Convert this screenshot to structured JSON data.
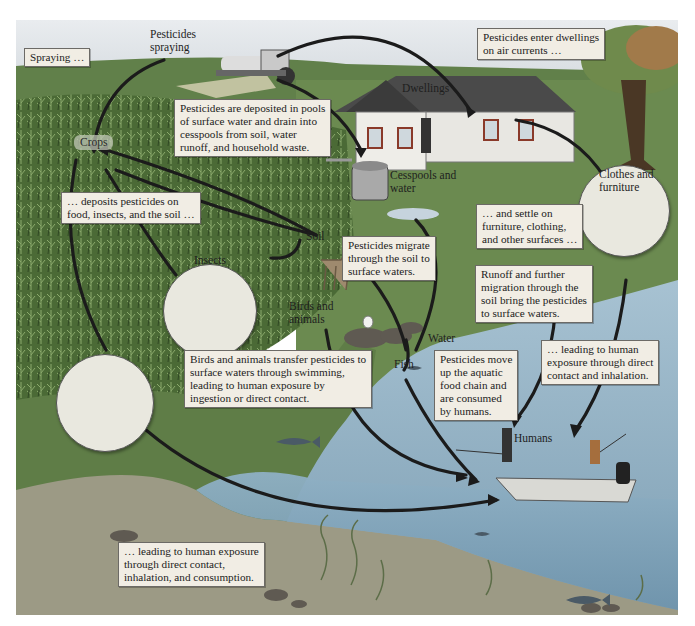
{
  "figure": {
    "colors": {
      "sky": "#dfe3e8",
      "field_green": "#5d7a45",
      "crop_dark": "#3f5a2e",
      "grass": "#6e8a52",
      "water": "#8fb0c4",
      "water_deep": "#7a9fb6",
      "shore": "#9a9a83",
      "callout_bg": "#f1ede4",
      "arrow": "#1c1c1c"
    }
  },
  "labels": {
    "pesticides_spraying": "Pesticides\nspraying",
    "dwellings": "Dwellings",
    "crops": "Crops",
    "cesspools": "Cesspools and\nwater",
    "soil": "Soil",
    "insects": "Insects",
    "birds_animals": "Birds and\nanimals",
    "water": "Water",
    "fish": "Fish",
    "clothes_furniture": "Clothes and\nfurniture",
    "humans": "Humans"
  },
  "callouts": {
    "spraying": "Spraying …",
    "enter_dwellings": "Pesticides enter dwellings\non air currents …",
    "deposited_pools": "Pesticides are deposited in pools\nof surface water and drain into\ncesspools from soil, water\nrunoff, and household waste.",
    "deposits_food": "… deposits pesticides on\nfood, insects, and the soil …",
    "settle_surfaces": "… and settle on\nfurniture, clothing,\nand other surfaces …",
    "migrate_soil": "Pesticides migrate\nthrough the soil to\nsurface waters.",
    "runoff": "Runoff and further\nmigration through the\nsoil bring the pesticides\nto surface waters.",
    "birds_transfer": "Birds and animals transfer pesticides to\nsurface waters through swimming,\nleading to human exposure by\ningestion or direct contact.",
    "food_chain": "Pesticides move\nup the aquatic\nfood chain and\nare consumed\nby humans.",
    "exposure_contact_inhalation": "… leading to human\nexposure through direct\ncontact and inhalation.",
    "exposure_consumption": "… leading to human exposure\nthrough direct contact,\ninhalation, and consumption."
  }
}
